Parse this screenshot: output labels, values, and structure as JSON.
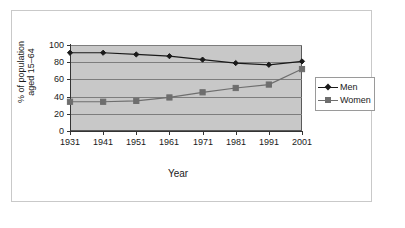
{
  "chart_data": {
    "type": "line",
    "title": "",
    "xlabel": "Year",
    "ylabel": "% of population aged 15–64",
    "ylabel_line1": "% of population",
    "ylabel_line2": "aged 15–64",
    "categories": [
      "1931",
      "1941",
      "1951",
      "1961",
      "1971",
      "1981",
      "1991",
      "2001"
    ],
    "x": [
      1931,
      1941,
      1951,
      1961,
      1971,
      1981,
      1991,
      2001
    ],
    "ylim": [
      0,
      100
    ],
    "yticks": [
      "0",
      "20",
      "40",
      "60",
      "80",
      "100"
    ],
    "ytick_values": [
      0,
      20,
      40,
      60,
      80,
      100
    ],
    "grid": true,
    "legend_position": "right",
    "plot_background": "#c8c8c8",
    "series": [
      {
        "name": "Men",
        "values": [
          91,
          91,
          89,
          87,
          83,
          79,
          77,
          81
        ],
        "color": "#1a1a1a",
        "marker": "diamond"
      },
      {
        "name": "Women",
        "values": [
          34,
          34,
          35,
          39,
          45,
          50,
          54,
          72
        ],
        "color": "#6e6e6e",
        "marker": "square"
      }
    ]
  },
  "legend": {
    "items": [
      {
        "label": "Men"
      },
      {
        "label": "Women"
      }
    ]
  }
}
